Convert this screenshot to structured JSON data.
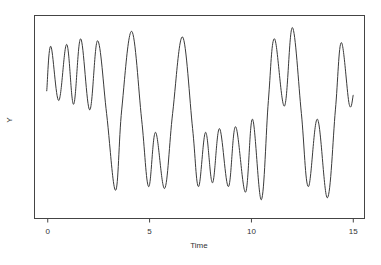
{
  "chart_data": {
    "type": "line",
    "title": "",
    "xlabel": "Time",
    "ylabel": "Y",
    "xlim": [
      -0.65,
      15.55
    ],
    "ylim": [
      0,
      1
    ],
    "x_ticks": [
      0,
      5,
      10,
      15
    ],
    "x_tick_labels": [
      "0",
      "5",
      "10",
      "15"
    ],
    "y_ticks": [],
    "grid": false,
    "legend": null,
    "line_color": "#3a3a3a",
    "y_units_note": "relative (no y tick labels shown)",
    "series": [
      {
        "name": "Y",
        "points": [
          [
            -0.05,
            0.63
          ],
          [
            0.15,
            0.87
          ],
          [
            0.54,
            0.58
          ],
          [
            0.93,
            0.88
          ],
          [
            1.27,
            0.56
          ],
          [
            1.62,
            0.91
          ],
          [
            2.06,
            0.53
          ],
          [
            2.45,
            0.9
          ],
          [
            2.89,
            0.51
          ],
          [
            3.33,
            0.1
          ],
          [
            3.63,
            0.53
          ],
          [
            4.12,
            0.95
          ],
          [
            4.61,
            0.48
          ],
          [
            4.95,
            0.12
          ],
          [
            5.29,
            0.41
          ],
          [
            5.74,
            0.11
          ],
          [
            6.13,
            0.51
          ],
          [
            6.62,
            0.92
          ],
          [
            7.11,
            0.43
          ],
          [
            7.4,
            0.12
          ],
          [
            7.75,
            0.41
          ],
          [
            8.09,
            0.14
          ],
          [
            8.43,
            0.43
          ],
          [
            8.87,
            0.12
          ],
          [
            9.22,
            0.44
          ],
          [
            9.71,
            0.09
          ],
          [
            10.05,
            0.48
          ],
          [
            10.49,
            0.05
          ],
          [
            10.83,
            0.58
          ],
          [
            11.13,
            0.91
          ],
          [
            11.62,
            0.55
          ],
          [
            12.01,
            0.97
          ],
          [
            12.45,
            0.51
          ],
          [
            12.79,
            0.12
          ],
          [
            13.24,
            0.48
          ],
          [
            13.73,
            0.06
          ],
          [
            14.12,
            0.53
          ],
          [
            14.41,
            0.89
          ],
          [
            14.8,
            0.56
          ],
          [
            15.0,
            0.61
          ]
        ]
      }
    ]
  },
  "labels": {
    "x_axis": "Time",
    "y_axis": "Y",
    "ticks": [
      "0",
      "5",
      "10",
      "15"
    ]
  }
}
